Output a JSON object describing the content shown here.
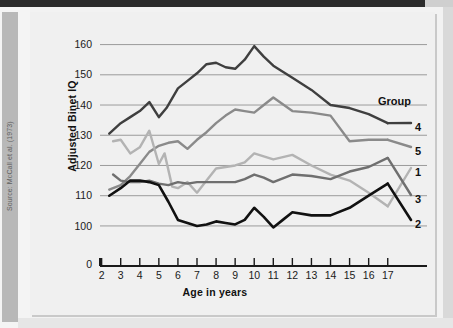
{
  "source_note": "Source: McCall et al. (1973)",
  "chart_data": {
    "type": "line",
    "title": "",
    "xlabel": "Age in years",
    "ylabel": "Adjusted Binet IQ",
    "xlim": [
      1.6,
      17.8
    ],
    "ylim": [
      95,
      164
    ],
    "xticks": [
      2,
      3,
      4,
      5,
      6,
      7,
      8,
      9,
      10,
      11,
      12,
      13,
      14,
      15,
      16,
      17
    ],
    "yticks": [
      100,
      110,
      120,
      130,
      140,
      150,
      160
    ],
    "y_axis_break_label": "0",
    "grid": "horizontal",
    "legend_title": "Group",
    "legend_position": "right",
    "legend_order": [
      "4",
      "5",
      "1",
      "3",
      "2"
    ],
    "series": [
      {
        "name": "4",
        "label": "4",
        "color": "#3f3f3f",
        "width": 2.4,
        "x": [
          2.4,
          3,
          3.5,
          4,
          4.5,
          5,
          5.4,
          6,
          6.5,
          7,
          7.5,
          8,
          8.5,
          9,
          9.5,
          10,
          10.5,
          11,
          12,
          13,
          14,
          15,
          16,
          17
        ],
        "y": [
          130.5,
          134,
          136,
          138,
          141,
          136,
          139,
          145.5,
          148,
          150.5,
          153.5,
          154,
          152.5,
          152,
          155,
          159.5,
          156,
          153,
          149,
          145,
          140,
          139,
          137,
          134
        ]
      },
      {
        "name": "5",
        "label": "5",
        "color": "#8a8a8a",
        "width": 2.4,
        "x": [
          2.4,
          3,
          3.5,
          4,
          4.5,
          5,
          5.5,
          6,
          6.5,
          7,
          7.5,
          8,
          8.5,
          9,
          9.5,
          10,
          10.5,
          11,
          12,
          13,
          14,
          15,
          16,
          17
        ],
        "y": [
          112,
          113.5,
          116.5,
          120.5,
          124.5,
          126.5,
          127.5,
          128,
          125.5,
          128.5,
          131,
          134,
          136.5,
          138.5,
          138,
          137.5,
          140,
          142.5,
          138,
          137.5,
          136.5,
          128,
          128.5,
          128.5
        ]
      },
      {
        "name": "1",
        "label": "1",
        "color": "#b3b3b3",
        "width": 2.4,
        "x": [
          2.6,
          3,
          3.5,
          4,
          4.5,
          5,
          5.3,
          5.7,
          6,
          6.5,
          7,
          7.5,
          8,
          8.5,
          9,
          9.5,
          10,
          10.5,
          11,
          12,
          13,
          14,
          15,
          16,
          17
        ],
        "y": [
          128,
          128.5,
          124,
          126,
          131.5,
          120.5,
          124,
          113,
          112.5,
          114.5,
          111,
          115,
          119,
          119.5,
          120,
          121,
          124,
          123,
          122,
          123.5,
          120,
          117,
          115,
          111,
          106.5
        ]
      },
      {
        "name": "3",
        "label": "3",
        "color": "#6f6f6f",
        "width": 2.4,
        "x": [
          2.6,
          3,
          3.5,
          4,
          4.5,
          5,
          5.5,
          6,
          6.5,
          7,
          7.5,
          8,
          8.5,
          9,
          9.5,
          10,
          10.5,
          11,
          12,
          13,
          14,
          15,
          16,
          17
        ],
        "y": [
          117,
          115,
          114.5,
          114.5,
          115,
          114,
          113.5,
          114.5,
          114,
          114.5,
          114.5,
          114.5,
          114.5,
          114.5,
          115.5,
          117,
          116,
          114.5,
          117,
          116.5,
          115.5,
          118,
          119.5,
          122.5
        ]
      },
      {
        "name": "2",
        "label": "2",
        "color": "#111111",
        "width": 2.6,
        "x": [
          2.4,
          3,
          3.5,
          4,
          4.5,
          5,
          5.5,
          6,
          6.5,
          7,
          7.5,
          8,
          8.5,
          9,
          9.5,
          10,
          10.5,
          11,
          11.5,
          12,
          13,
          14,
          15,
          16,
          17
        ],
        "y": [
          110,
          112.5,
          115,
          115,
          114.5,
          113.5,
          108,
          102,
          101,
          100,
          100.5,
          101.5,
          101,
          100.5,
          102,
          106,
          103,
          99.5,
          102,
          104.5,
          103.5,
          103.5,
          106,
          110,
          114
        ]
      }
    ]
  },
  "legend_items": [
    {
      "label": "4",
      "top": 115
    },
    {
      "label": "5",
      "top": 139
    },
    {
      "label": "1",
      "top": 160
    },
    {
      "label": "3",
      "top": 187
    },
    {
      "label": "2",
      "top": 212
    }
  ]
}
